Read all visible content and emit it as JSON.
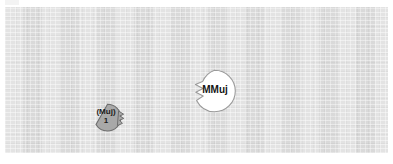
{
  "canvas": {
    "background_color": "#dcdcdc",
    "border_color": "#d2d2d2"
  },
  "diagram": {
    "type": "node-callout-diagram",
    "nodes": [
      {
        "id": "muj1",
        "shape": "callout-circle",
        "tail_side": "right",
        "fill": "#a8a8a8",
        "stroke": "#6e6e6e",
        "text_color": "#1b1b1b",
        "label_line1": "(Muj)",
        "label_line2": "1"
      },
      {
        "id": "mmuj",
        "shape": "callout-circle",
        "tail_side": "left",
        "fill": "#ffffff",
        "stroke": "#9a9a9a",
        "text_color": "#141414",
        "label_line1": "MMuj",
        "label_line2": ""
      }
    ]
  }
}
